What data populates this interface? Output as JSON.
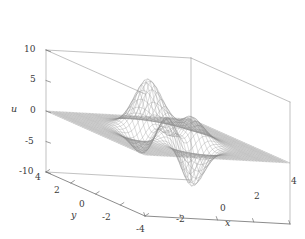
{
  "figure": {
    "width": 305,
    "height": 239,
    "background": "#ffffff",
    "line_color": "#8a8a8a",
    "box_color": "#9a9a9a",
    "text_color": "#3a3a3a"
  },
  "chart_data": {
    "type": "surface",
    "render": "wireframe-mesh",
    "title": "",
    "xlabel": "x",
    "ylabel": "y",
    "zlabel": "u",
    "xlim": [
      -4,
      4
    ],
    "ylim": [
      -4,
      4
    ],
    "zlim": [
      -10,
      10
    ],
    "xticks": [
      -4,
      -2,
      0,
      2,
      4
    ],
    "yticks": [
      4,
      2,
      0,
      -2,
      -4
    ],
    "zticks": [
      10,
      5,
      0,
      -5,
      -10
    ],
    "xtick_labels": [
      "-4",
      "-2",
      "0",
      "2",
      "4"
    ],
    "ytick_labels": [
      "4",
      "2",
      "0",
      "-2",
      "-4"
    ],
    "ztick_labels": [
      "10",
      "5",
      "0",
      "-5",
      "-10"
    ],
    "grid": false,
    "legend": false,
    "mesh_divisions": 44,
    "function": "peaks",
    "formula": "u = 3*(1-x)^2*exp(-x^2-(y+1)^2) - 10*(x/5 - x^3 - y^5)*exp(-x^2-y^2) - (1/3)*exp(-(x+1)^2-y^2)",
    "data_range": {
      "zmin": -6.55,
      "zmax": 8.08
    },
    "features": [
      {
        "name": "primary-peak",
        "x": -0.01,
        "y": 1.58,
        "z": 8.08
      },
      {
        "name": "secondary-peak",
        "x": -1.35,
        "y": 0.2,
        "z": 3.78
      },
      {
        "name": "deep-valley",
        "x": 0.23,
        "y": -1.63,
        "z": -6.55
      },
      {
        "name": "shallow-dip",
        "x": -1.33,
        "y": -0.0,
        "z": -0.33
      }
    ],
    "projection": {
      "azimuth_deg": -37.5,
      "elevation_deg": 30,
      "type": "orthographic"
    }
  },
  "axes": {
    "z_ticks": [
      {
        "label": "10",
        "left": 24,
        "top": 45
      },
      {
        "label": "5",
        "left": 30,
        "top": 75
      },
      {
        "label": "0",
        "left": 30,
        "top": 106
      },
      {
        "label": "-5",
        "left": 25,
        "top": 137
      },
      {
        "label": "-10",
        "left": 19,
        "top": 167
      }
    ],
    "y_ticks": [
      {
        "label": "4",
        "left": 35,
        "top": 173
      },
      {
        "label": "2",
        "left": 54,
        "top": 186
      },
      {
        "label": "0",
        "left": 79,
        "top": 200
      },
      {
        "label": "-2",
        "left": 102,
        "top": 213
      },
      {
        "label": "-4",
        "left": 136,
        "top": 225
      }
    ],
    "x_ticks": [
      {
        "label": "-2",
        "left": 176,
        "top": 215
      },
      {
        "label": "0",
        "left": 220,
        "top": 204
      },
      {
        "label": "2",
        "left": 254,
        "top": 192
      },
      {
        "label": "4",
        "left": 291,
        "top": 177
      }
    ],
    "titles": {
      "x": {
        "text": "x",
        "left": 225,
        "top": 218
      },
      "y": {
        "text": "y",
        "left": 71,
        "top": 210
      },
      "z": {
        "text": "u",
        "left": 11,
        "top": 104
      }
    }
  }
}
